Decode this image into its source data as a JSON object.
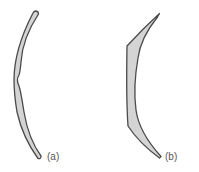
{
  "figure": {
    "panels": [
      {
        "id": "a",
        "label": "(a)",
        "description": "thin curved crescent with a small inward bump at mid-height"
      },
      {
        "id": "b",
        "label": "(b)",
        "description": "thicker angular crescent tapering to points at top and bottom"
      }
    ],
    "colors": {
      "fill": "#d4d4d4",
      "stroke": "#4a4a4a",
      "label": "#555555",
      "background": "#ffffff"
    }
  }
}
